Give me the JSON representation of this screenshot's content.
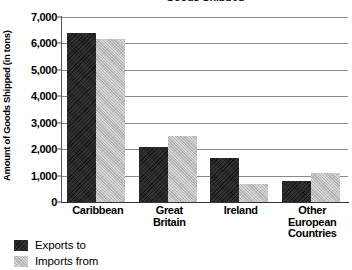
{
  "chart_data": {
    "type": "bar",
    "title": "Goods Shipped",
    "xlabel": "",
    "ylabel": "Amount of Goods Shipped (in tons)",
    "ylim": [
      0,
      7000
    ],
    "yticks": [
      0,
      1000,
      2000,
      3000,
      4000,
      5000,
      6000,
      7000
    ],
    "ytick_labels": [
      "0",
      "1,000",
      "2,000",
      "3,000",
      "4,000",
      "5,000",
      "6,000",
      "7,000"
    ],
    "grid": true,
    "legend_position": "below-left",
    "categories": [
      "Caribbean",
      "Great Britain",
      "Ireland",
      "Other European Countries"
    ],
    "category_label_lines": [
      [
        "Caribbean"
      ],
      [
        "Great",
        "Britain"
      ],
      [
        "Ireland"
      ],
      [
        "Other",
        "European",
        "Countries"
      ]
    ],
    "series": [
      {
        "name": "Exports to",
        "color": "#262626",
        "values": [
          6400,
          2100,
          1650,
          800
        ]
      },
      {
        "name": "Imports from",
        "color": "#b8b8b8",
        "values": [
          6150,
          2500,
          700,
          1100
        ]
      }
    ]
  },
  "legend": {
    "items": [
      {
        "label": "Exports to"
      },
      {
        "label": "Imports from"
      }
    ]
  }
}
